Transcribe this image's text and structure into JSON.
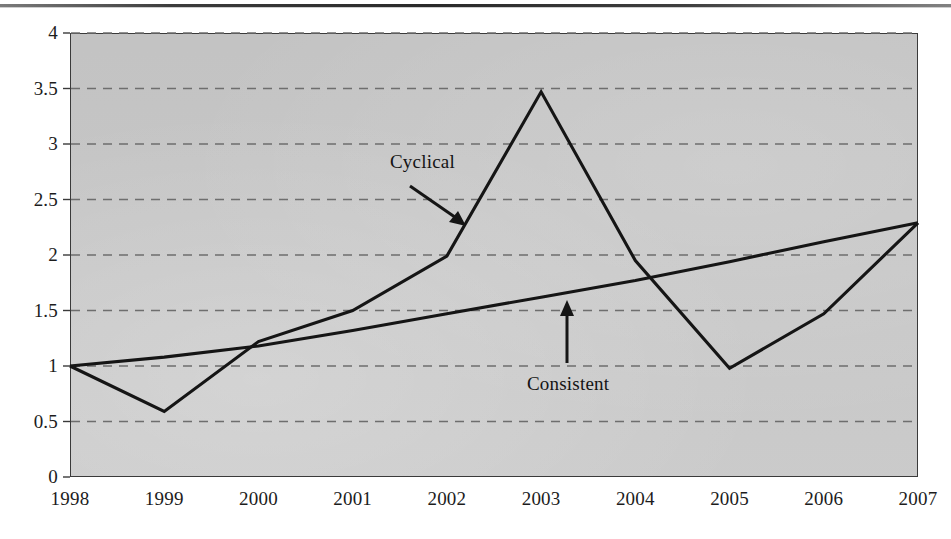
{
  "chart_data": {
    "type": "line",
    "title": "",
    "subtitle": "",
    "xlabel": "",
    "ylabel": "",
    "categories": [
      "1998",
      "1999",
      "2000",
      "2001",
      "2002",
      "2003",
      "2004",
      "2005",
      "2006",
      "2007"
    ],
    "x": [
      1998,
      1999,
      2000,
      2001,
      2002,
      2003,
      2004,
      2005,
      2006,
      2007
    ],
    "series": [
      {
        "name": "Cyclical",
        "values": [
          1.0,
          0.59,
          1.22,
          1.5,
          1.99,
          3.47,
          1.95,
          0.98,
          1.47,
          2.29
        ],
        "color": "#151515"
      },
      {
        "name": "Consistent",
        "values": [
          1.0,
          1.08,
          1.18,
          1.32,
          1.47,
          1.62,
          1.77,
          1.94,
          2.12,
          2.29
        ],
        "color": "#151515"
      }
    ],
    "ylim": [
      0,
      4
    ],
    "yticks": [
      0,
      0.5,
      1,
      1.5,
      2,
      2.5,
      3,
      3.5,
      4
    ],
    "ytick_labels": [
      "0",
      "0.5",
      "1",
      "1.5",
      "2",
      "2.5",
      "3",
      "3.5",
      "4"
    ],
    "xtick_labels": [
      "1998",
      "1999",
      "2000",
      "2001",
      "2002",
      "2003",
      "2004",
      "2005",
      "2006",
      "2007"
    ],
    "grid": true,
    "grid_style": "dashed",
    "grid_color": "#6e6e6e",
    "legend": "none",
    "plot_background": "#c9c9c9",
    "annotations": [
      {
        "id": "cyclical",
        "text": "Cyclical",
        "arrow": "points-down-right-to-cyclical-line"
      },
      {
        "id": "consistent",
        "text": "Consistent",
        "arrow": "points-up-to-consistent-line"
      }
    ]
  },
  "axis": {
    "y_labels": [
      "4",
      "3.5",
      "3",
      "2.5",
      "2",
      "1.5",
      "1",
      "0.5",
      "0"
    ],
    "x_labels": [
      "1998",
      "1999",
      "2000",
      "2001",
      "2002",
      "2003",
      "2004",
      "2005",
      "2006",
      "2007"
    ]
  },
  "annotations": {
    "cyclical_label": "Cyclical",
    "consistent_label": "Consistent"
  },
  "colors": {
    "plot_fill": "#c9c9c9",
    "line": "#151515",
    "grid": "#6e6e6e",
    "axis": "#3a3a3a",
    "text": "#1c1c1c"
  }
}
